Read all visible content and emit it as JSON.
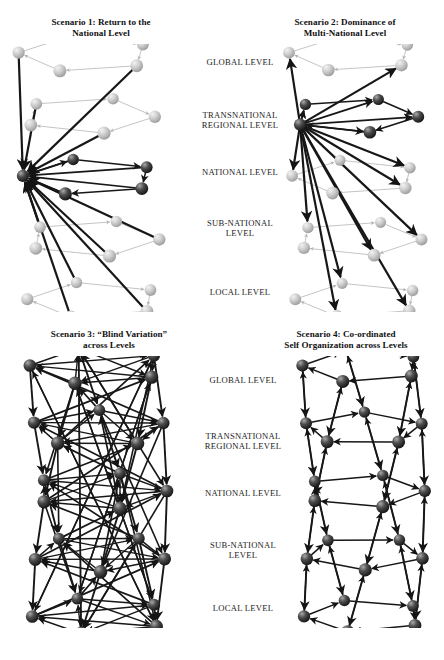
{
  "figure": {
    "top_cropped_text": "",
    "background_color": "#ffffff",
    "ink_color": "#1a1a1a"
  },
  "scenarios": [
    {
      "id": "scenario-1",
      "title_line1": "Scenario 1: Return to the",
      "title_line2": "National Level",
      "emphasis_level": "NATIONAL LEVEL",
      "description": "Thick dark arrows converge on a single hub node at the national level; other levels drawn in light grey."
    },
    {
      "id": "scenario-2",
      "title_line1": "Scenario 2: Dominance of",
      "title_line2": "Multi-National Level",
      "emphasis_level": "TRANSNATIONAL REGIONAL LEVEL",
      "description": "Thick dark arrows radiate from a hub node at the transnational regional level."
    },
    {
      "id": "scenario-3",
      "title_line1": "Scenario 3: “Blind Variation”",
      "title_line2": "across Levels",
      "emphasis_level": "ALL LEVELS",
      "description": "Dense dark criss-crossing arrows connect nodes on every level in all directions."
    },
    {
      "id": "scenario-4",
      "title_line1": "Scenario 4: Co-ordinated",
      "title_line2": "Self Organization across Levels",
      "emphasis_level": "ALL LEVELS",
      "description": "Dark vertical arrows link corresponding nodes across adjacent levels plus lateral arrows within each level."
    }
  ],
  "levels_top": [
    {
      "line1": "GLOBAL LEVEL",
      "line2": ""
    },
    {
      "line1": "TRANSNATIONAL",
      "line2": "REGIONAL LEVEL"
    },
    {
      "line1": "NATIONAL LEVEL",
      "line2": ""
    },
    {
      "line1": "SUB-NATIONAL",
      "line2": "LEVEL"
    },
    {
      "line1": "LOCAL LEVEL",
      "line2": ""
    }
  ],
  "levels_bottom": [
    {
      "line1": "GLOBAL LEVEL",
      "line2": ""
    },
    {
      "line1": "TRANSNATIONAL",
      "line2": "REGIONAL LEVEL"
    },
    {
      "line1": "NATIONAL LEVEL",
      "line2": ""
    },
    {
      "line1": "SUB-NATIONAL",
      "line2": "LEVEL"
    },
    {
      "line1": "LOCAL LEVEL",
      "line2": ""
    }
  ],
  "chart_data": {
    "type": "diagram",
    "levels": [
      "GLOBAL LEVEL",
      "TRANSNATIONAL REGIONAL LEVEL",
      "NATIONAL LEVEL",
      "SUB-NATIONAL LEVEL",
      "LOCAL LEVEL"
    ],
    "nodes_per_level": 5,
    "node_style": "shaded 3d sphere",
    "edge_style": "straight arrow",
    "panels": [
      {
        "name": "Scenario 1: Return to the National Level",
        "hub_level_index": 2,
        "hub_emphasis": "strong",
        "edge_density": "low"
      },
      {
        "name": "Scenario 2: Dominance of Multi-National Level",
        "hub_level_index": 1,
        "hub_emphasis": "strong",
        "edge_density": "low"
      },
      {
        "name": "Scenario 3: “Blind Variation” across Levels",
        "hub_level_index": null,
        "hub_emphasis": "none",
        "edge_density": "very high"
      },
      {
        "name": "Scenario 4: Co-ordinated Self Organization across Levels",
        "hub_level_index": null,
        "hub_emphasis": "none",
        "edge_density": "medium, vertical"
      }
    ]
  }
}
